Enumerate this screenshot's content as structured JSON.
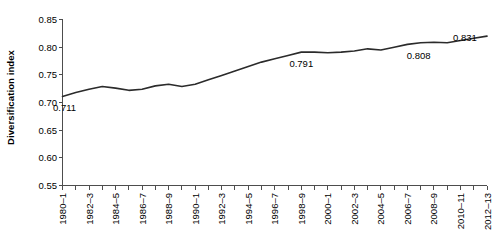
{
  "chart_data": {
    "type": "line",
    "title": "",
    "xlabel": "",
    "ylabel": "Diversification index",
    "ylim": [
      0.55,
      0.85
    ],
    "ytick_values": [
      0.55,
      0.6,
      0.65,
      0.7,
      0.75,
      0.8,
      0.85
    ],
    "ytick_labels": [
      "0.55",
      "0.60",
      "0.65",
      "0.70",
      "0.75",
      "0.80",
      "0.85"
    ],
    "grid": false,
    "legend": "none",
    "x_tick_labels": [
      "1980–1",
      "1982–3",
      "1984–5",
      "1986–7",
      "1988–9",
      "1990–1",
      "1992–3",
      "1994–5",
      "1996–7",
      "1998–9",
      "2000–1",
      "2002–3",
      "2004–5",
      "2006–7",
      "2008–9",
      "2010–11",
      "2012–13"
    ],
    "x": [
      "1980–1",
      "1981–2",
      "1982–3",
      "1983–4",
      "1984–5",
      "1985–6",
      "1986–7",
      "1987–8",
      "1988–9",
      "1989–90",
      "1990–1",
      "1991–2",
      "1992–3",
      "1993–4",
      "1994–5",
      "1995–6",
      "1996–7",
      "1997–8",
      "1998–9",
      "1999–2000",
      "2000–1",
      "2001–2",
      "2002–3",
      "2003–4",
      "2004–5",
      "2005–6",
      "2006–7",
      "2007–8",
      "2008–9",
      "2009–10",
      "2010–11",
      "2011–12",
      "2012–13"
    ],
    "values": [
      0.711,
      0.718,
      0.724,
      0.729,
      0.726,
      0.722,
      0.724,
      0.73,
      0.733,
      0.729,
      0.733,
      0.741,
      0.749,
      0.757,
      0.765,
      0.773,
      0.779,
      0.785,
      0.791,
      0.791,
      0.79,
      0.791,
      0.793,
      0.797,
      0.795,
      0.8,
      0.805,
      0.808,
      0.809,
      0.808,
      0.812,
      0.816,
      0.82
    ],
    "annotations": [
      {
        "label": "0.711",
        "x": "1980–1",
        "value": 0.711
      },
      {
        "label": "0.791",
        "x": "1998–9",
        "value": 0.791
      },
      {
        "label": "0.808",
        "x": "2007–8",
        "value": 0.808
      },
      {
        "label": "0.831",
        "x": "2012–13",
        "value": 0.831
      }
    ],
    "series_color": "#2b2b2b"
  }
}
